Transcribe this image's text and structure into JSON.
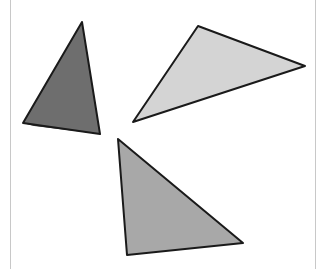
{
  "diagram": {
    "shapes": [
      {
        "id": "triangle-dark",
        "shade": "dark",
        "fill": "#6e6e6e",
        "shadow": "#3e3e3e"
      },
      {
        "id": "triangle-light",
        "shade": "light",
        "fill": "#d4d4d4",
        "shadow": "#5a5a5a"
      },
      {
        "id": "triangle-medium",
        "shade": "medium",
        "fill": "#a8a8a8",
        "shadow": "#4a4a4a"
      }
    ],
    "outline_color": "#1a1a1a",
    "frame_color": "#c8c8c8"
  }
}
